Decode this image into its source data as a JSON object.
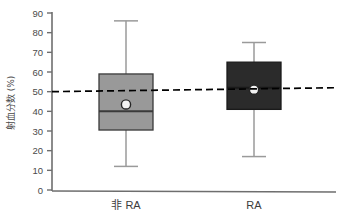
{
  "chart_data": {
    "type": "box",
    "title": "",
    "subtitle": "",
    "xlabel": "",
    "ylabel": "射血分数 (%)",
    "ylim": [
      0,
      90
    ],
    "yticks": [
      0,
      10,
      20,
      30,
      40,
      50,
      60,
      70,
      80,
      90
    ],
    "ytick_labels": [
      "0",
      "10",
      "20",
      "30",
      "40",
      "50",
      "60",
      "70",
      "80",
      "90"
    ],
    "grid": false,
    "legend": null,
    "categories": [
      "非 RA",
      "RA"
    ],
    "boxes": [
      {
        "name": "非 RA",
        "whisker_low": 12,
        "q1": 30.5,
        "median": 40,
        "q3": 59,
        "whisker_high": 86,
        "mean": 43.5,
        "fill_color": "#999999",
        "edge_color": "#3a3a3a"
      },
      {
        "name": "RA",
        "whisker_low": 17,
        "q1": 41,
        "median": 52,
        "q3": 65,
        "whisker_high": 75,
        "mean": 51,
        "fill_color": "#2b2b2b",
        "edge_color": "#1a1a1a"
      }
    ],
    "reference_line": {
      "style": "dashed",
      "color": "#000000",
      "y_left": 50,
      "y_right": 52
    },
    "annotations": []
  },
  "axis": {
    "y_title": "射血分数 (%)",
    "x_tick_labels": [
      "非 RA",
      "RA"
    ]
  },
  "colors": {
    "group_non_ra": "#999999",
    "group_ra": "#2b2b2b",
    "axis": "#6e6e6e",
    "reference": "#000000",
    "mean_marker_fill": "#f2f2f2"
  }
}
